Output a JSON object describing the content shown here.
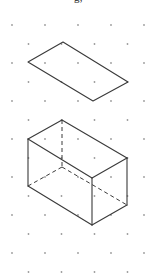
{
  "page": {
    "width": 157,
    "height": 279,
    "background_color": "#ffffff"
  },
  "clipped_header_text": "g,",
  "grid": {
    "name": "isometric-dot-grid",
    "dot_color": "#9a9a9a",
    "dot_radius": 0.9,
    "column_spacing": 33,
    "row_spacing": 19,
    "row_offset": 16.5,
    "origin_x": 12,
    "origin_y": 25,
    "columns": 6,
    "rows": 14
  },
  "figures": [
    {
      "name": "parallelogram-top",
      "label": "flat rectangle in isometric projection",
      "type": "parallelogram",
      "stroke_color": "#3a3a3a",
      "stroke_width": 1.1,
      "vertices": [
        [
          63,
          42
        ],
        [
          128,
          82
        ],
        [
          93,
          101
        ],
        [
          28,
          62
        ]
      ]
    },
    {
      "name": "cuboid-bottom",
      "label": "rectangular prism with hidden edges dashed",
      "type": "cuboid",
      "stroke_color": "#3a3a3a",
      "stroke_width": 1.1,
      "hidden_edge_style": "dashed",
      "vertices": {
        "top_back": [
          62,
          120
        ],
        "top_left": [
          28,
          139
        ],
        "top_front": [
          92,
          178
        ],
        "top_right": [
          127,
          158
        ],
        "bottom_back": [
          62,
          167
        ],
        "bottom_left": [
          28,
          186
        ],
        "bottom_front": [
          92,
          225
        ],
        "bottom_right": [
          127,
          205
        ]
      },
      "solid_edges": [
        [
          "top_back",
          "top_left"
        ],
        [
          "top_left",
          "top_front"
        ],
        [
          "top_front",
          "top_right"
        ],
        [
          "top_right",
          "top_back"
        ],
        [
          "top_left",
          "bottom_left"
        ],
        [
          "top_front",
          "bottom_front"
        ],
        [
          "top_right",
          "bottom_right"
        ],
        [
          "bottom_left",
          "bottom_front"
        ],
        [
          "bottom_front",
          "bottom_right"
        ]
      ],
      "hidden_edges": [
        [
          "top_back",
          "bottom_back"
        ],
        [
          "bottom_back",
          "bottom_left"
        ],
        [
          "bottom_back",
          "bottom_right"
        ]
      ]
    }
  ]
}
